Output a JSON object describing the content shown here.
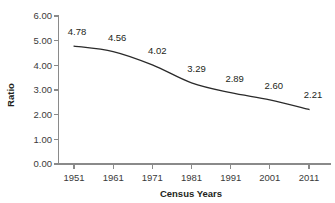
{
  "chart_data": {
    "type": "line",
    "title": "",
    "xlabel": "Census Years",
    "ylabel": "Ratio",
    "categories": [
      "1951",
      "1961",
      "1971",
      "1981",
      "1991",
      "2001",
      "2011"
    ],
    "x": [
      1951,
      1961,
      1971,
      1981,
      1991,
      2001,
      2011
    ],
    "values": [
      4.78,
      4.56,
      4.02,
      3.29,
      2.89,
      2.6,
      2.21
    ],
    "point_labels": [
      "4.78",
      "4.56",
      "4.02",
      "3.29",
      "2.89",
      "2.60",
      "2.21"
    ],
    "ylim": [
      0.0,
      6.0
    ],
    "ytick_labels": [
      "6.00",
      "5.00",
      "4.00",
      "3.00",
      "2.00",
      "1.00",
      "0.00"
    ],
    "ytick_values": [
      6.0,
      5.0,
      4.0,
      3.0,
      2.0,
      1.0,
      0.0
    ],
    "xtick_labels": [
      "1951",
      "1961",
      "1971",
      "1981",
      "1991",
      "2001",
      "2011"
    ],
    "grid": false,
    "legend": false,
    "legend_position": "none",
    "series": [
      {
        "name": "Ratio",
        "values": [
          4.78,
          4.56,
          4.02,
          3.29,
          2.89,
          2.6,
          2.21
        ],
        "color": "#2a2a2a",
        "smooth": true,
        "markers": false
      }
    ],
    "colors": {
      "line": "#2a2a2a",
      "axis": "#8a8a8a",
      "text": "#231f20",
      "tick_text": "#3a3a3a",
      "background": "#ffffff"
    }
  }
}
